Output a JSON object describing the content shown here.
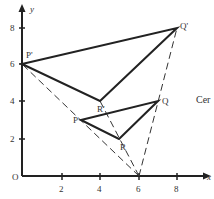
{
  "diagram": {
    "type": "enlargement",
    "centre": {
      "label": "",
      "x": 6,
      "y": 0
    },
    "axes": {
      "x_label": "x",
      "y_label": "y",
      "origin_label": "O",
      "x_ticks": [
        "2",
        "4",
        "6",
        "8"
      ],
      "y_ticks": [
        "2",
        "4",
        "6",
        "8"
      ]
    },
    "object": {
      "P": {
        "label": "P",
        "x": 3,
        "y": 3
      },
      "Q": {
        "label": "Q",
        "x": 7,
        "y": 4
      },
      "R": {
        "label": "R",
        "x": 5,
        "y": 2
      }
    },
    "image": {
      "P_prime": {
        "label": "P'",
        "x": 0,
        "y": 6
      },
      "Q_prime": {
        "label": "Q'",
        "x": 8,
        "y": 8
      },
      "R_prime": {
        "label": "R'",
        "x": 4,
        "y": 4
      }
    },
    "side_text": "Cer",
    "colors": {
      "line": "#222222",
      "text": "#333333",
      "background": "#ffffff"
    }
  }
}
